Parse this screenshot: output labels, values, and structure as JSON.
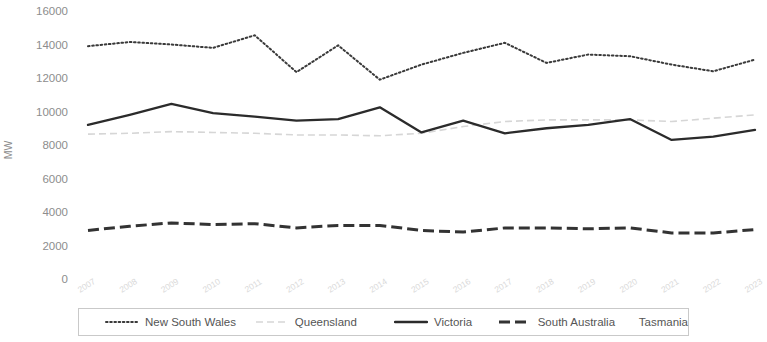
{
  "chart_data": {
    "type": "line",
    "title": "",
    "xlabel": "",
    "ylabel": "MW",
    "ylim": [
      0,
      16000
    ],
    "ytick_values": [
      16000,
      14000,
      12000,
      10000,
      8000,
      6000,
      4000,
      2000,
      0
    ],
    "ytick_labels": [
      "16000",
      "14000",
      "12000",
      "10000",
      "8000",
      "6000",
      "4000",
      "2000",
      "0"
    ],
    "grid": false,
    "legend_position": "bottom",
    "categories": [
      "2007",
      "2008",
      "2009",
      "2010",
      "2011",
      "2012",
      "2013",
      "2014",
      "2015",
      "2016",
      "2017",
      "2018",
      "2019",
      "2020",
      "2021",
      "2022",
      "2023"
    ],
    "x": [
      2007,
      2008,
      2009,
      2010,
      2011,
      2012,
      2013,
      2014,
      2015,
      2016,
      2017,
      2018,
      2019,
      2020,
      2021,
      2022,
      2023
    ],
    "series": [
      {
        "name": "New South Wales",
        "style": "dotted",
        "color": "#3a3a3a",
        "values": [
          13900,
          14150,
          14000,
          13800,
          14550,
          12350,
          13950,
          11900,
          12800,
          13500,
          14100,
          12900,
          13400,
          13300,
          12800,
          12400,
          13100
        ]
      },
      {
        "name": "Queensland",
        "style": "dashed-light",
        "color": "#d6d6d6",
        "values": [
          8650,
          8700,
          8800,
          8750,
          8700,
          8600,
          8600,
          8550,
          8700,
          9100,
          9400,
          9500,
          9500,
          9500,
          9400,
          9600,
          9800
        ]
      },
      {
        "name": "Victoria",
        "style": "solid",
        "color": "#2b2b2b",
        "values": [
          9200,
          9800,
          10450,
          9900,
          9700,
          9450,
          9550,
          10250,
          8750,
          9450,
          8700,
          9000,
          9200,
          9550,
          8300,
          8500,
          8900
        ]
      },
      {
        "name": "South Australia",
        "style": "dash-dot",
        "color": "#333333",
        "values": [
          2900,
          3150,
          3350,
          3250,
          3300,
          3050,
          3200,
          3200,
          2900,
          2800,
          3050,
          3050,
          3000,
          3050,
          2750,
          2750,
          2950
        ]
      },
      {
        "name": "Tasmania",
        "style": "none",
        "color": "#ffffff",
        "values": [
          1750,
          1800,
          1780,
          1760,
          1750,
          1700,
          1720,
          1700,
          1680,
          1700,
          1720,
          1700,
          1690,
          1700,
          1680,
          1670,
          1690
        ]
      }
    ]
  },
  "legend": {
    "items": [
      {
        "label": "New South Wales"
      },
      {
        "label": "Queensland"
      },
      {
        "label": "Victoria"
      },
      {
        "label": "South Australia"
      },
      {
        "label": "Tasmania"
      }
    ]
  }
}
